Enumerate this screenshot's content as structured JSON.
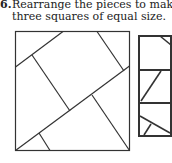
{
  "problem": {
    "number": "6.",
    "line1": "Rearrange the pieces to make",
    "line2": "three squares of equal size."
  },
  "figure": {
    "big_square_label": "dissected square",
    "strip_label": "three target squares"
  }
}
